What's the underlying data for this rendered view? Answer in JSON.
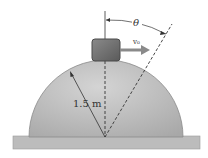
{
  "diagram": {
    "labels": {
      "radius": "1.5 m",
      "angle": "θ",
      "velocity": "v₀"
    },
    "colors": {
      "dome": "#b3b3b3",
      "dome_highlight": "#d0d0d0",
      "ground": "#bcbcbc",
      "block": "#6e6e6e",
      "block_border": "#4a4a4a",
      "arrow": "#8a8a8a",
      "line": "#333333"
    }
  }
}
